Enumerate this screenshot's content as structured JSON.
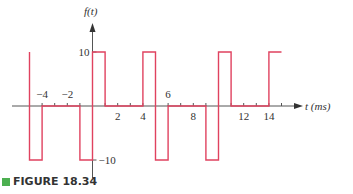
{
  "figure": {
    "caption": "FIGURE 18.34",
    "caption_marker_color": "#4caf50"
  },
  "chart_data": {
    "type": "line",
    "title": "",
    "ylabel": "f(t)",
    "xlabel": "t (ms)",
    "x_tick_labels": [
      -4,
      -2,
      2,
      4,
      6,
      8,
      12,
      14
    ],
    "x_minor_ticks": [
      -5,
      -4,
      -3,
      -2,
      -1,
      1,
      2,
      3,
      4,
      5,
      6,
      7,
      8,
      9,
      10,
      11,
      12,
      13,
      14,
      15
    ],
    "y_tick_labels": [
      10,
      -10
    ],
    "xlim": [
      -6.4,
      16.5
    ],
    "ylim": [
      -12,
      14
    ],
    "grid": false,
    "line_color": "#e0425f",
    "segments": [
      {
        "t_start": -5.3,
        "t_end": -5,
        "value": 10
      },
      {
        "t_start": -5,
        "t_end": -4,
        "value": -10
      },
      {
        "t_start": -4,
        "t_end": -1,
        "value": 0
      },
      {
        "t_start": -1,
        "t_end": 0,
        "value": -10
      },
      {
        "t_start": 0,
        "t_end": 1,
        "value": 10
      },
      {
        "t_start": 1,
        "t_end": 4,
        "value": 0
      },
      {
        "t_start": 4,
        "t_end": 5,
        "value": 10
      },
      {
        "t_start": 5,
        "t_end": 6,
        "value": -10
      },
      {
        "t_start": 6,
        "t_end": 9,
        "value": 0
      },
      {
        "t_start": 9,
        "t_end": 10,
        "value": -10
      },
      {
        "t_start": 10,
        "t_end": 11,
        "value": 10
      },
      {
        "t_start": 11,
        "t_end": 14,
        "value": 0
      },
      {
        "t_start": 14,
        "t_end": 15,
        "value": 10
      }
    ],
    "points": [
      [
        -5,
        10
      ],
      [
        -5,
        -10
      ],
      [
        -4,
        -10
      ],
      [
        -4,
        0
      ],
      [
        -1,
        0
      ],
      [
        -1,
        -10
      ],
      [
        0,
        -10
      ],
      [
        0,
        10
      ],
      [
        1,
        10
      ],
      [
        1,
        0
      ],
      [
        4,
        0
      ],
      [
        4,
        10
      ],
      [
        5,
        10
      ],
      [
        5,
        -10
      ],
      [
        6,
        -10
      ],
      [
        6,
        0
      ],
      [
        9,
        0
      ],
      [
        9,
        -10
      ],
      [
        10,
        -10
      ],
      [
        10,
        10
      ],
      [
        11,
        10
      ],
      [
        11,
        0
      ],
      [
        14,
        0
      ],
      [
        14,
        10
      ],
      [
        15,
        10
      ]
    ]
  }
}
